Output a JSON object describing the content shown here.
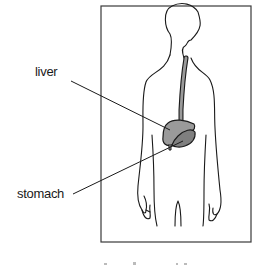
{
  "diagram": {
    "labels": {
      "liver": "liver",
      "stomach": "stomach"
    },
    "colors": {
      "outline": "#1a1a1a",
      "organ_fill": "#9a9a9a",
      "organ_fill_dark": "#7f7f7f",
      "background": "#ffffff"
    }
  }
}
